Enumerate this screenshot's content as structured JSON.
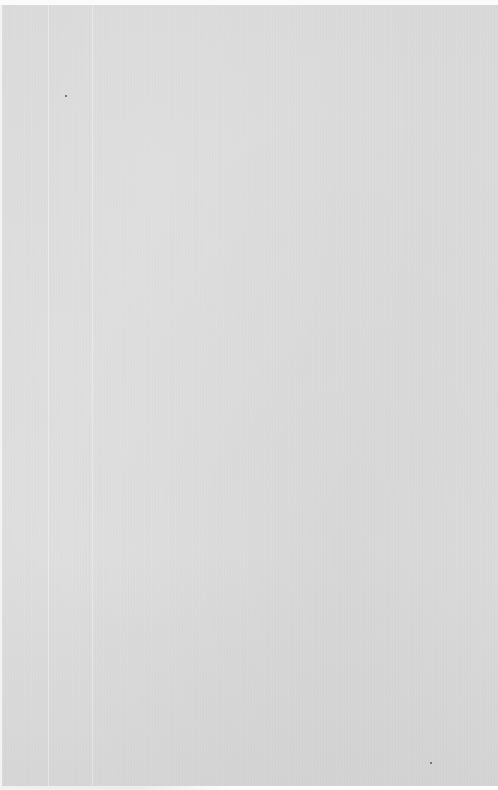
{
  "document": {
    "type": "scanned-page",
    "content": "",
    "colors": {
      "paper": "#dbdbdb",
      "top_edge": "#fbfbfb",
      "speck": "#555555"
    },
    "specks": [
      {
        "x": 65,
        "y": 95
      },
      {
        "x": 430,
        "y": 762
      }
    ]
  }
}
